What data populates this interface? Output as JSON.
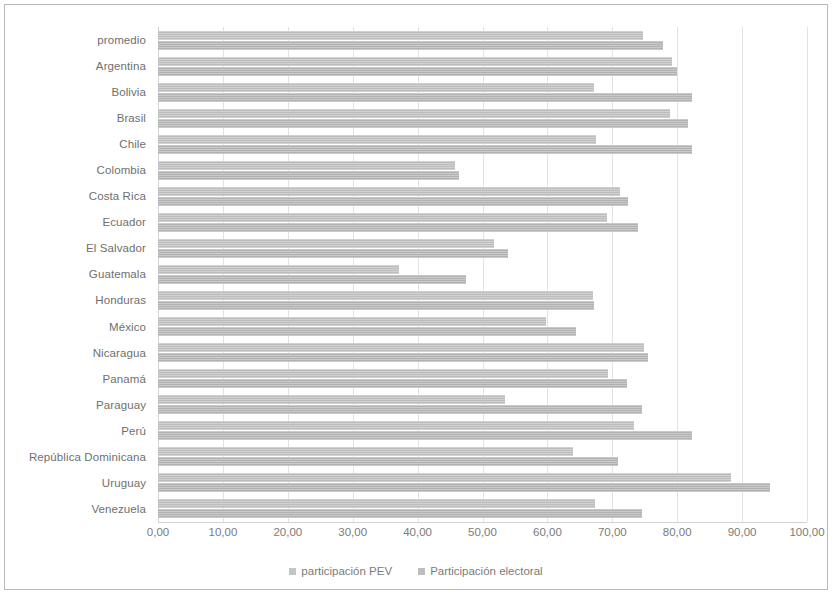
{
  "chart_data": {
    "type": "bar",
    "orientation": "horizontal",
    "title": "",
    "subtitle": "",
    "xlabel": "",
    "ylabel": "",
    "xlim": [
      0,
      100
    ],
    "grid": true,
    "legend_position": "bottom",
    "tick_labels": [
      "0,00",
      "10,00",
      "20,00",
      "30,00",
      "40,00",
      "50,00",
      "60,00",
      "70,00",
      "80,00",
      "90,00",
      "100,00"
    ],
    "tick_values": [
      0,
      10,
      20,
      30,
      40,
      50,
      60,
      70,
      80,
      90,
      100
    ],
    "categories": [
      "promedio",
      "Argentina",
      "Bolivia",
      "Brasil",
      "Chile",
      "Colombia",
      "Costa Rica",
      "Ecuador",
      "El Salvador",
      "Guatemala",
      "Honduras",
      "México",
      "Nicaragua",
      "Panamá",
      "Paraguay",
      "Perú",
      "República Dominicana",
      "Uruguay",
      "Venezuela"
    ],
    "series": [
      {
        "name": "participación PEV",
        "color": "#c4c4c4",
        "values": [
          74.8,
          79.2,
          67.2,
          78.9,
          67.5,
          45.8,
          71.2,
          69.2,
          51.8,
          37.1,
          67.0,
          59.8,
          74.9,
          69.4,
          53.5,
          73.3,
          64.0,
          88.3,
          67.3
        ]
      },
      {
        "name": "Participación electoral",
        "color": "#bdbdbd",
        "values": [
          77.8,
          79.9,
          82.3,
          81.7,
          82.3,
          46.4,
          72.4,
          74.0,
          53.9,
          47.4,
          67.2,
          64.4,
          75.5,
          72.3,
          74.6,
          82.3,
          70.9,
          94.3,
          74.5
        ]
      }
    ]
  },
  "legend": {
    "items": [
      {
        "label": "participación PEV",
        "swatch": "pev"
      },
      {
        "label": "Participación electoral",
        "swatch": "elec"
      }
    ]
  }
}
